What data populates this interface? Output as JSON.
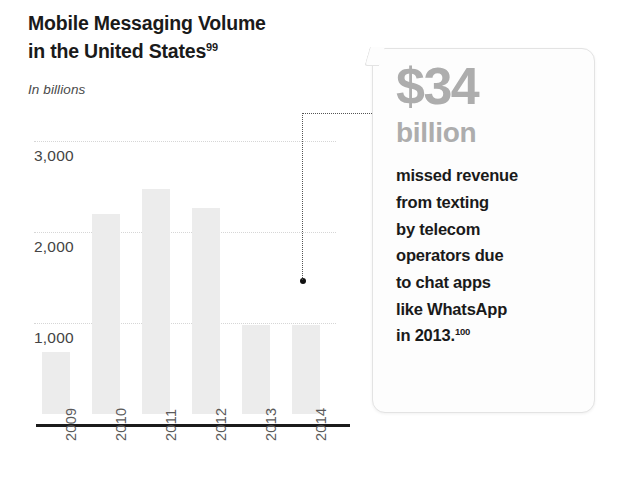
{
  "header": {
    "title_line1": "Mobile Messaging Volume",
    "title_line2": "in the United States",
    "title_superscript": "99",
    "subtitle": "In billions"
  },
  "chart_data": {
    "type": "bar",
    "title": "Mobile Messaging Volume in the United States",
    "subtitle": "In billions",
    "xlabel": "",
    "ylabel": "In billions",
    "categories": [
      "2009",
      "2010",
      "2011",
      "2012",
      "2013",
      "2014"
    ],
    "values": [
      680,
      2200,
      2470,
      2260,
      980,
      980
    ],
    "ylim": [
      0,
      3100
    ],
    "yticks": [
      1000,
      2000,
      3000
    ],
    "ytick_labels": [
      "1,000",
      "2,000",
      "3,000"
    ],
    "grid": true,
    "legend": false,
    "bar_color": "#ececec",
    "axis_color": "#1b1b1b",
    "gridline_color": "#d6d6d6",
    "annotation": {
      "value": "$34",
      "unit": "billion",
      "text": "missed revenue from texting by telecom operators due to chat apps like WhatsApp in 2013.",
      "superscript": "100",
      "points_to": "2013"
    }
  },
  "callout": {
    "amount": "$34",
    "unit": "billion",
    "line1": "missed revenue",
    "line2": "from texting",
    "line3": "by telecom",
    "line4": "operators due",
    "line5": "to chat apps",
    "line6": "like WhatsApp",
    "line7": "in 2013.",
    "superscript": "100"
  }
}
